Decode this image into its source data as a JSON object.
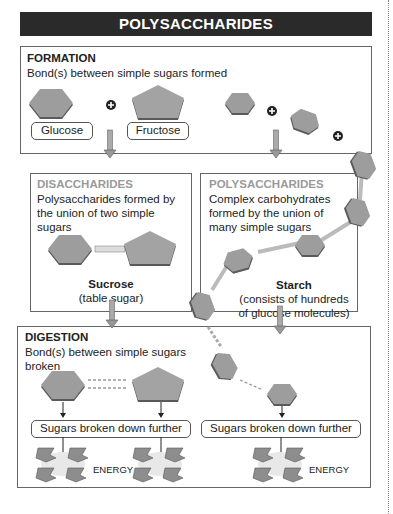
{
  "title": "POLYSACCHARIDES",
  "formation": {
    "heading": "FORMATION",
    "description": "Bond(s) between simple sugars formed",
    "labels": [
      "Glucose",
      "Fructose"
    ]
  },
  "disaccharides": {
    "heading": "DISACCHARIDES",
    "description_lines": [
      "Polysaccharides formed by",
      "the union of two simple",
      "sugars"
    ],
    "example_name": "Sucrose",
    "example_note": "(table sugar)"
  },
  "polysaccharides": {
    "heading": "POLYSACCHARIDES",
    "description_lines": [
      "Complex carbohydrates",
      "formed by the union of",
      "many simple sugars"
    ],
    "example_name": "Starch",
    "example_note_lines": [
      "(consists of hundreds",
      "of glucose molecules)"
    ]
  },
  "digestion": {
    "heading": "DIGESTION",
    "description_lines": [
      "Bond(s) between simple sugars",
      "broken"
    ],
    "result_label": "Sugars broken down further",
    "energy_label": "ENERGY"
  },
  "colors": {
    "title_bg": "#2a2a2a",
    "shape_fill": "#9d9d9d",
    "shape_edge": "#5a5a5a",
    "heading_gray": "#9a9a9a"
  }
}
